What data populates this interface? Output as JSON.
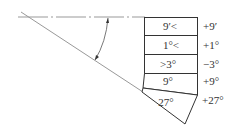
{
  "diagram": {
    "type": "angle-gauge-block-stack",
    "blocks": [
      {
        "label": "9′<",
        "effect": "+9′"
      },
      {
        "label": "1°<",
        "effect": "+1°"
      },
      {
        "label": ">3°",
        "effect": "−3°"
      },
      {
        "label": "9°",
        "effect": "+9°"
      },
      {
        "label": "27°",
        "effect": "+27°"
      }
    ]
  }
}
